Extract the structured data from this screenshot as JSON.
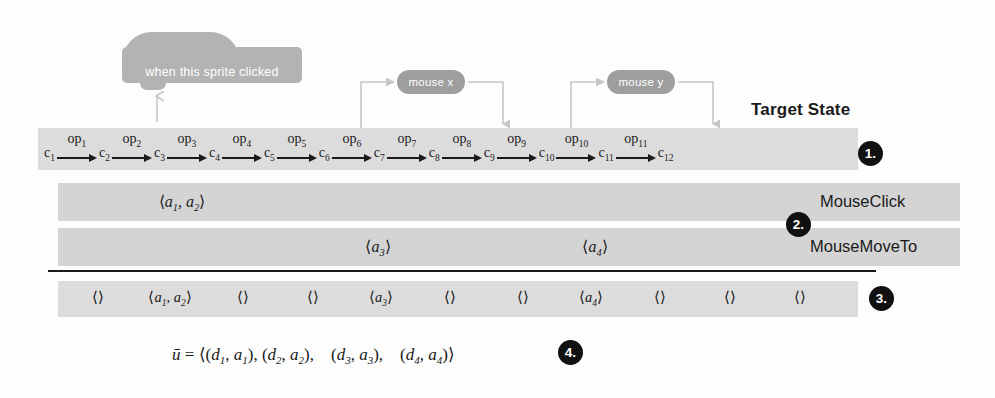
{
  "figure": {
    "target_state_label": "Target State",
    "scratch_block_label": "when this sprite clicked",
    "reporter_x_label": "mouse x",
    "reporter_y_label": "mouse y"
  },
  "chain": {
    "states": [
      "c₁",
      "c₂",
      "c₃",
      "c₄",
      "c₅",
      "c₆",
      "c₇",
      "c₈",
      "c₉",
      "c₁₀",
      "c₁₁",
      "c₁₂"
    ],
    "operations": [
      "op₁",
      "op₂",
      "op₃",
      "op₄",
      "op₅",
      "op₆",
      "op₇",
      "op₈",
      "op₉",
      "op₁₀",
      "op₁₁"
    ]
  },
  "rows": {
    "mouse_click": {
      "label": "MouseClick",
      "tuple": "⟨a₁, a₂⟩"
    },
    "mouse_move_to": {
      "label": "MouseMoveTo",
      "tuple_1": "⟨a₃⟩",
      "tuple_2": "⟨a₄⟩"
    },
    "combined": {
      "tuples": [
        "⟨⟩",
        "⟨a₁, a₂⟩",
        "⟨⟩",
        "⟨⟩",
        "⟨a₃⟩",
        "⟨⟩",
        "⟨⟩",
        "⟨a₄⟩",
        "⟨⟩",
        "⟨⟩",
        "⟨⟩"
      ]
    }
  },
  "formula": {
    "text": "ū = ⟨(d₁, a₁), (d₂, a₂),    (d₃, a₃),    (d₄, a₄)⟩"
  },
  "callouts": {
    "one": "1.",
    "two": "2.",
    "three": "3.",
    "four": "4."
  },
  "colors": {
    "band": "#d4d4d4",
    "band_light": "#dcdcdc",
    "block": "#b3b3b3",
    "pill": "#9e9e9e",
    "ink": "#1a1a1a",
    "callout_bg": "#111111"
  }
}
